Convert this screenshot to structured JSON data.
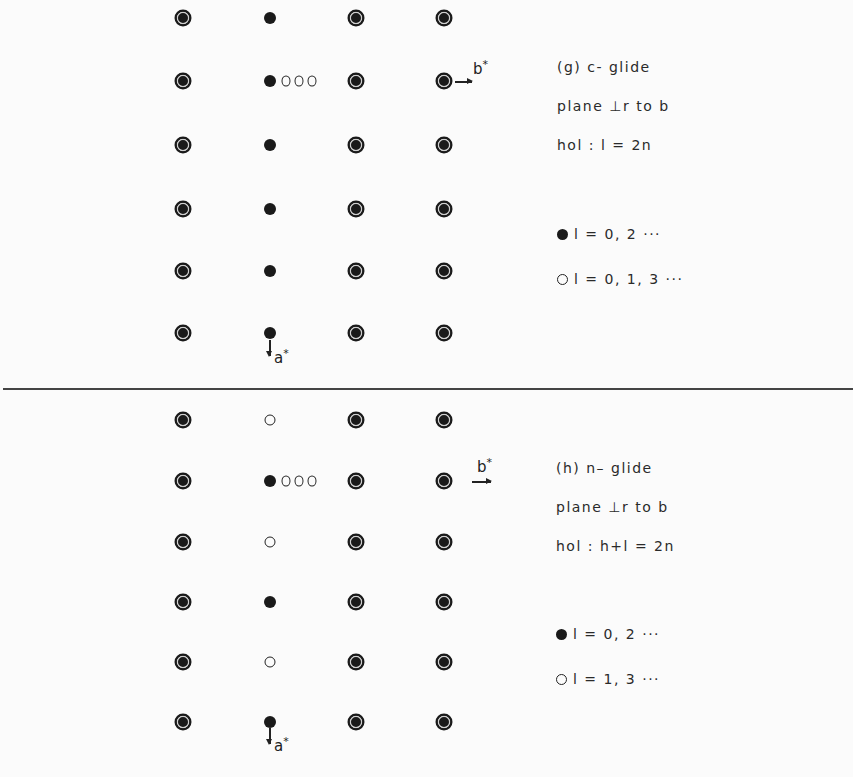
{
  "panels": [
    {
      "id": "g",
      "title": "(g) c- glide",
      "line2": "plane ⊥r to b",
      "line3": "hol : l = 2n",
      "legend": [
        {
          "symbol": "filled",
          "text": "l = 0, 2 ···"
        },
        {
          "symbol": "open",
          "text": "l = 0, 1, 3 ···"
        }
      ],
      "axis_b": "b",
      "axis_a": "a",
      "axis_star": "*",
      "column_types": [
        "ringed",
        "filled",
        "ringed",
        "ringed"
      ],
      "rows": [
        [
          "ringed",
          "filled",
          "ringed",
          "ringed"
        ],
        [
          "ringed",
          "filled",
          "ringed",
          "ringed"
        ],
        [
          "ringed",
          "filled",
          "ringed",
          "ringed"
        ],
        [
          "ringed",
          "filled",
          "ringed",
          "ringed"
        ],
        [
          "ringed",
          "filled",
          "ringed",
          "ringed"
        ],
        [
          "ringed",
          "filled",
          "ringed",
          "ringed"
        ]
      ],
      "extra_row_index": 1,
      "extra_open_dots": 3
    },
    {
      "id": "h",
      "title": "(h) n– glide",
      "line2": "plane ⊥r to b",
      "line3": "hol : h+l = 2n",
      "legend": [
        {
          "symbol": "filled",
          "text": "l = 0, 2 ···"
        },
        {
          "symbol": "open",
          "text": "l = 1, 3 ···"
        }
      ],
      "axis_b": "b",
      "axis_a": "a",
      "axis_star": "*",
      "rows": [
        [
          "ringed",
          "open",
          "ringed",
          "ringed"
        ],
        [
          "ringed",
          "filled",
          "ringed",
          "ringed"
        ],
        [
          "ringed",
          "open",
          "ringed",
          "ringed"
        ],
        [
          "ringed",
          "filled",
          "ringed",
          "ringed"
        ],
        [
          "ringed",
          "open",
          "ringed",
          "ringed"
        ],
        [
          "ringed",
          "filled",
          "ringed",
          "ringed"
        ]
      ],
      "extra_row_index": 1,
      "extra_open_dots": 3
    }
  ],
  "colors": {
    "ink": "#1a1a1a",
    "paper": "#fbfbfb",
    "ring": "#cfcfcf"
  }
}
